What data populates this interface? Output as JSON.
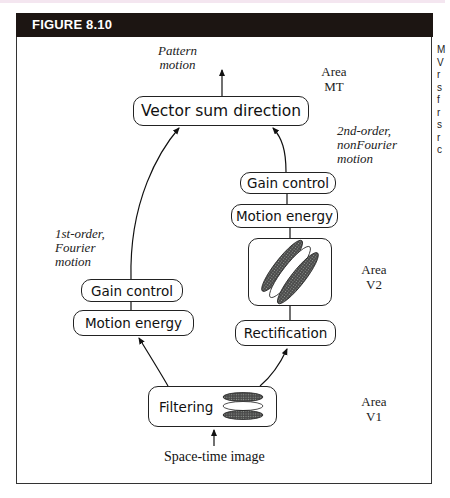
{
  "figure": {
    "title": "FIGURE 8.10",
    "side_caption_fragment": [
      "M",
      "V",
      "r",
      "s",
      "f",
      "r",
      "s",
      "r",
      "c"
    ]
  },
  "diagram": {
    "nodes": {
      "vector_sum": "Vector sum direction",
      "left_gain": "Gain control",
      "left_motion_energy": "Motion energy",
      "right_gain": "Gain control",
      "right_motion_energy": "Motion energy",
      "rectification": "Rectification",
      "filtering": "Filtering"
    },
    "labels": {
      "pattern_motion": [
        "Pattern",
        "motion"
      ],
      "first_order": [
        "1st-order,",
        "Fourier",
        "motion"
      ],
      "second_order": [
        "2nd-order,",
        "nonFourier",
        "motion"
      ],
      "input": "Space-time image"
    },
    "areas": {
      "mt": [
        "Area",
        "MT"
      ],
      "v2": [
        "Area",
        "V2"
      ],
      "v1": [
        "Area",
        "V1"
      ]
    }
  }
}
